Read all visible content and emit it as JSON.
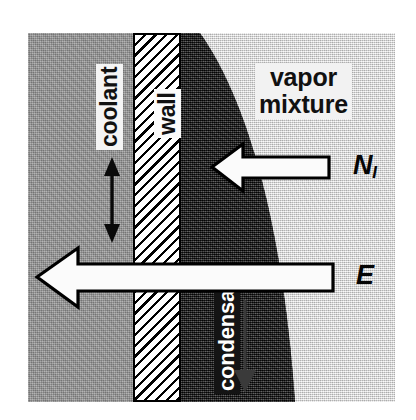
{
  "figure": {
    "domain_kind": "diagram"
  },
  "regions": [
    {
      "name": "coolant",
      "label": "coolant",
      "fill": "#9a9a9a",
      "text_color": "#111111"
    },
    {
      "name": "wall",
      "label": "wall",
      "fill": "#ffffff",
      "text_color": "#111111",
      "pattern": "diagonal-hatch"
    },
    {
      "name": "condensate",
      "label": "condensate",
      "fill": "#1a1a1a",
      "text_color": "#ffffff"
    },
    {
      "name": "vapor",
      "label_line1": "vapor",
      "label_line2": "mixture",
      "fill": "#e4e4e4",
      "text_color": "#111111"
    }
  ],
  "labels": {
    "vapor_line1": "vapor",
    "vapor_line2": "mixture",
    "coolant": "coolant",
    "wall": "wall",
    "condensate": "condensate",
    "flux_ni_base": "N",
    "flux_ni_sub": "I",
    "flux_e": "E"
  },
  "arrows": [
    {
      "name": "noncondensable-flux",
      "symbol": "N_I",
      "direction": "left",
      "style": "hollow-white-outlined",
      "meaning": "noncondensable gas flux toward interface"
    },
    {
      "name": "energy-flux",
      "symbol": "E",
      "direction": "left",
      "style": "hollow-white-outlined",
      "meaning": "energy flux through condensate and wall into coolant"
    },
    {
      "name": "coolant-flow",
      "symbol": "",
      "direction": "vertical-double",
      "style": "thin-solid-black",
      "meaning": "coolant circulation"
    },
    {
      "name": "condensate-drainage",
      "symbol": "",
      "direction": "down",
      "style": "thin-dark",
      "meaning": "condensate film draining downward"
    }
  ],
  "colors": {
    "coolant_gray": "#9a9a9a",
    "vapor_light": "#e4e4e4",
    "condensate_dark": "#1a1a1a",
    "wall_white": "#ffffff",
    "outline_black": "#000000",
    "arrow_fill": "#fbfbfb"
  }
}
